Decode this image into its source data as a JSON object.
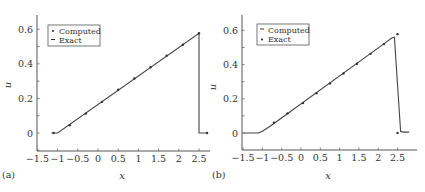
{
  "chart_data": [
    {
      "panel": "(a)",
      "type": "line",
      "xlabel": "x",
      "ylabel": "u",
      "xlim": [
        -1.5,
        2.7
      ],
      "ylim": [
        -0.1,
        0.68
      ],
      "xticks": [
        "-1.5",
        "-1",
        "-0.5",
        "0",
        "0.5",
        "1",
        "1.5",
        "2",
        "2.5"
      ],
      "yticks": [
        "0",
        "0.2",
        "0.4",
        "0.6"
      ],
      "grid": false,
      "legend": {
        "position": "upper-left",
        "entries": [
          {
            "label": "Computed",
            "marker": "dot"
          },
          {
            "label": "Exact",
            "marker": "line"
          }
        ]
      },
      "series": [
        {
          "name": "Exact",
          "style": "line",
          "x": [
            -1.15,
            -1.0,
            2.5,
            2.5,
            2.7
          ],
          "y": [
            0,
            0,
            0.576,
            0,
            0
          ]
        },
        {
          "name": "Computed",
          "style": "dot",
          "x": [
            -1.1,
            -0.7,
            -0.3,
            0.1,
            0.5,
            0.9,
            1.3,
            1.7,
            2.1,
            2.5,
            2.7
          ],
          "y": [
            0,
            0.045,
            0.112,
            0.18,
            0.25,
            0.315,
            0.38,
            0.447,
            0.51,
            0.577,
            0
          ]
        }
      ]
    },
    {
      "panel": "(b)",
      "type": "line",
      "xlabel": "x",
      "ylabel": "u",
      "xlim": [
        -1.5,
        2.85
      ],
      "ylim": [
        -0.1,
        0.68
      ],
      "xticks": [
        "-1.5",
        "-1",
        "-0.5",
        "0",
        "0.5",
        "1",
        "1.5",
        "2",
        "2.5"
      ],
      "yticks": [
        "0",
        "0.2",
        "0.4",
        "0.6"
      ],
      "grid": false,
      "legend": {
        "position": "upper-left",
        "entries": [
          {
            "label": "Computed",
            "marker": "line"
          },
          {
            "label": "Exact",
            "marker": "dot"
          }
        ]
      },
      "series": [
        {
          "name": "Computed",
          "style": "line",
          "x": [
            -1.5,
            -1.1,
            -1.0,
            -0.8,
            2.2,
            2.35,
            2.42,
            2.58,
            2.65,
            2.8
          ],
          "y": [
            0,
            0,
            0.01,
            0.04,
            0.53,
            0.555,
            0.56,
            0.01,
            0.005,
            0.005
          ]
        },
        {
          "name": "Exact",
          "style": "dot",
          "x": [
            -0.7,
            -0.35,
            0.05,
            0.4,
            0.75,
            1.1,
            1.45,
            1.8,
            2.15,
            2.5,
            2.5
          ],
          "y": [
            0.06,
            0.115,
            0.175,
            0.233,
            0.29,
            0.348,
            0.405,
            0.463,
            0.52,
            0.578,
            0
          ]
        }
      ]
    }
  ],
  "panels": {
    "a": {
      "label": "(a)",
      "xlabel": "x",
      "ylabel": "u",
      "legend": [
        "Computed",
        "Exact"
      ]
    },
    "b": {
      "label": "(b)",
      "xlabel": "x",
      "ylabel": "u",
      "legend": [
        "Computed",
        "Exact"
      ]
    }
  }
}
